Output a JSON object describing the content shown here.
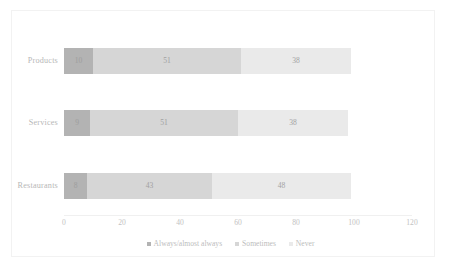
{
  "chart_data": {
    "type": "bar",
    "orientation": "horizontal",
    "stacked": true,
    "title": "",
    "subtitle": "",
    "xlabel": "",
    "ylabel": "",
    "categories": [
      "Products",
      "Services",
      "Restaurants"
    ],
    "series": [
      {
        "name": "Always/almost always",
        "color": "#b3b3b3",
        "values": [
          10,
          9,
          8
        ]
      },
      {
        "name": "Sometimes",
        "color": "#d6d6d6",
        "values": [
          51,
          51,
          43
        ]
      },
      {
        "name": "Never",
        "color": "#eaeaea",
        "values": [
          38,
          38,
          48
        ]
      }
    ],
    "xticks": [
      "0",
      "20",
      "40",
      "60",
      "80",
      "100",
      "120"
    ],
    "xlim": [
      0,
      120
    ],
    "grid": false,
    "legend_position": "bottom",
    "annotations": []
  },
  "legend": {
    "items": [
      {
        "label": "Always/almost always",
        "color": "#b3b3b3"
      },
      {
        "label": "Sometimes",
        "color": "#d6d6d6"
      },
      {
        "label": "Never",
        "color": "#eaeaea"
      }
    ]
  }
}
